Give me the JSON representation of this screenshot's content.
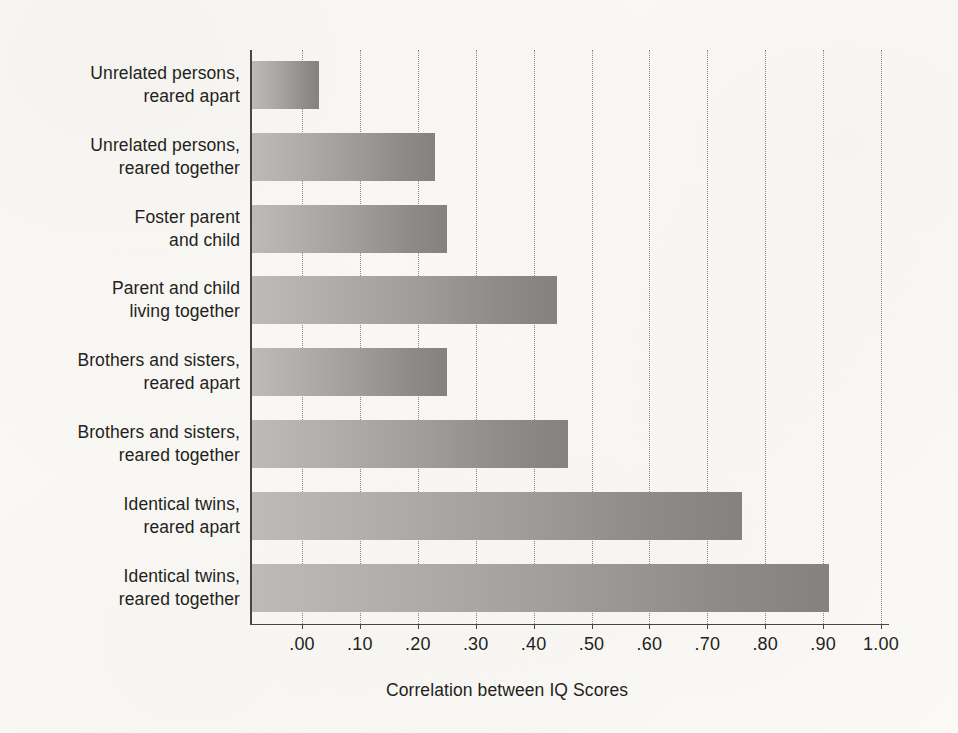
{
  "chart_data": {
    "type": "bar",
    "orientation": "horizontal",
    "title": "",
    "xlabel": "Correlation between IQ Scores",
    "ylabel": "",
    "xlim": [
      0.0,
      1.0
    ],
    "grid": "vertical-dotted",
    "legend": "none",
    "categories": [
      "Unrelated persons,\nreared apart",
      "Unrelated persons,\nreared together",
      "Foster parent\nand child",
      "Parent and child\nliving together",
      "Brothers and sisters,\nreared apart",
      "Brothers and sisters,\nreared together",
      "Identical twins,\nreared apart",
      "Identical twins,\nreared together"
    ],
    "values": [
      0.03,
      0.23,
      0.25,
      0.44,
      0.25,
      0.46,
      0.76,
      0.91
    ],
    "xticks": [
      0.0,
      0.1,
      0.2,
      0.3,
      0.4,
      0.5,
      0.6,
      0.7,
      0.8,
      0.9,
      1.0
    ],
    "xtick_labels": [
      ".00",
      ".10",
      ".20",
      ".30",
      ".40",
      ".50",
      ".60",
      ".70",
      ".80",
      ".90",
      "1.00"
    ],
    "bar_fill_start": "#bdbbb8",
    "bar_fill_end": "#848280",
    "axis_color": "#4a4542",
    "grid_color": "#8d8781",
    "background": "#fbfaf7",
    "text_color": "#231f20"
  }
}
